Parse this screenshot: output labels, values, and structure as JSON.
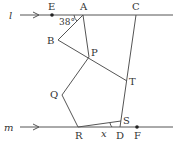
{
  "diagram": {
    "type": "geometry",
    "lines": [
      {
        "name": "l",
        "label": "l",
        "direction": "arrow-right"
      },
      {
        "name": "m",
        "label": "m",
        "direction": "arrow-right"
      }
    ],
    "points": {
      "A": "A",
      "B": "B",
      "C": "C",
      "D": "D",
      "E": "E",
      "F": "F",
      "P": "P",
      "Q": "Q",
      "R": "R",
      "S": "S",
      "T": "T"
    },
    "angles": {
      "EAB": "38°",
      "x": "x"
    }
  }
}
